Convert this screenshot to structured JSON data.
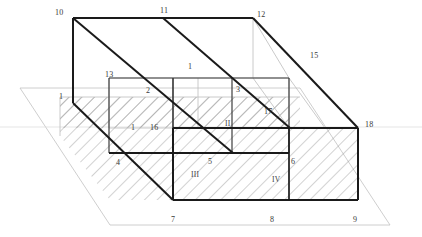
{
  "figure": {
    "type": "technical-line-drawing",
    "background_color": "#ffffff",
    "stroke_colors": {
      "heavy_edge": "#1a1a1a",
      "medium_edge": "#3d3d3d",
      "light_construction": "#b9b9b9",
      "hatch": "#8c8c8c",
      "label_text": "#3a3a3a"
    },
    "stroke_widths": {
      "heavy_edge": 2.0,
      "medium_edge": 1.1,
      "light_construction": 0.7,
      "hatch": 0.6
    }
  },
  "labels": {
    "vertex_numbers": [
      {
        "id": "10",
        "text": "10",
        "x": 55,
        "y": 9
      },
      {
        "id": "11",
        "text": "11",
        "x": 160,
        "y": 7
      },
      {
        "id": "12",
        "text": "12",
        "x": 257,
        "y": 11
      },
      {
        "id": "15",
        "text": "15",
        "x": 310,
        "y": 52
      },
      {
        "id": "13",
        "text": "13",
        "x": 105,
        "y": 71
      },
      {
        "id": "1",
        "text": "1",
        "x": 59,
        "y": 93
      },
      {
        "id": "2",
        "text": "2",
        "x": 146,
        "y": 87
      },
      {
        "id": "3",
        "text": "3",
        "x": 236,
        "y": 86
      },
      {
        "id": "17",
        "text": "17",
        "x": 264,
        "y": 108
      },
      {
        "id": "18",
        "text": "18",
        "x": 365,
        "y": 121
      },
      {
        "id": "16",
        "text": "16",
        "x": 150,
        "y": 124
      },
      {
        "id": "4",
        "text": "4",
        "x": 116,
        "y": 159
      },
      {
        "id": "5",
        "text": "5",
        "x": 208,
        "y": 158
      },
      {
        "id": "6",
        "text": "6",
        "x": 291,
        "y": 158
      },
      {
        "id": "7",
        "text": "7",
        "x": 171,
        "y": 216
      },
      {
        "id": "8",
        "text": "8",
        "x": 270,
        "y": 216
      },
      {
        "id": "9",
        "text": "9",
        "x": 353,
        "y": 216
      },
      {
        "id": "1b",
        "text": "1",
        "x": 188,
        "y": 63
      },
      {
        "id": "1c",
        "text": "1",
        "x": 131,
        "y": 124
      }
    ],
    "region_numerals": [
      {
        "id": "II",
        "text": "II",
        "x": 225,
        "y": 120
      },
      {
        "id": "III",
        "text": "III",
        "x": 191,
        "y": 171
      },
      {
        "id": "IV",
        "text": "IV",
        "x": 272,
        "y": 176
      }
    ]
  },
  "geometry": {
    "top_face": {
      "points": "73,18 253,18 289,78 109,78",
      "note": "upper rectangle in isometric projection"
    },
    "bottom_front_face": {
      "points": "109,78 289,78 289,200 109,200"
    },
    "cutting_plane": {
      "points": "20,88 300,88 390,225 110,225",
      "color": "#b9b9b9",
      "note": "light gray inclined sectioning plane"
    },
    "hatched_region": {
      "note": "cross-section produced by the plane, 45 degree hatch lines"
    }
  }
}
